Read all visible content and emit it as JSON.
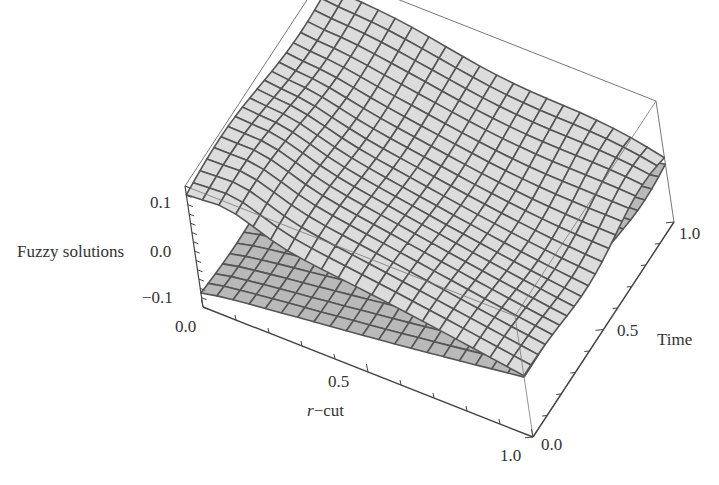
{
  "chart_data": {
    "type": "surface3d",
    "title": "",
    "xlabel": "r-cut",
    "ylabel": "Time",
    "zlabel": "Fuzzy solutions",
    "x_ticks": [
      "0.0",
      "0.5",
      "1.0"
    ],
    "y_ticks": [
      "0.0",
      "0.5",
      "1.0"
    ],
    "z_ticks": [
      "-0.1",
      "0.0",
      "0.1"
    ],
    "xlim": [
      0,
      1
    ],
    "ylim": [
      0,
      1
    ],
    "zlim": [
      -0.13,
      0.13
    ],
    "grid_lines": 20,
    "box": true,
    "series": [
      {
        "name": "upper fuzzy solution",
        "description": "upper bound surface, near 0.1 at r=0 decreasing toward 0 at r=1",
        "z_at_r0": 0.1,
        "z_at_r1": 0.0
      },
      {
        "name": "lower fuzzy solution",
        "description": "lower bound surface, near -0.1 at r=0 increasing toward 0 at r=1",
        "z_at_r0": -0.1,
        "z_at_r1": 0.0
      }
    ],
    "colors": {
      "surface": "#dcdcdc",
      "surface_shade": "#b9b9b9",
      "mesh": "#555555",
      "box": "#777777"
    }
  },
  "labels": {
    "zlabel": "Fuzzy solutions",
    "z_top": "0.1",
    "z_mid": "0.0",
    "z_bot": "−0.1",
    "x_start": "0.0",
    "x_mid": "0.5",
    "x_end": "1.0",
    "x_name_italic": "r",
    "x_name_rest": "−cut",
    "y_start": "0.0",
    "y_mid": "0.5",
    "y_end": "1.0",
    "y_name": "Time"
  }
}
